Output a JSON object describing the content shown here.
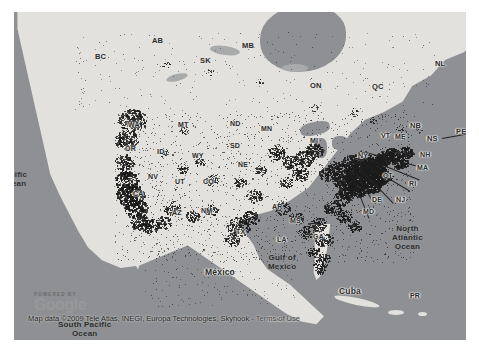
{
  "map": {
    "provider": "Google Maps",
    "attribution": {
      "powered_by": "POWERED BY",
      "brand": "Google",
      "data_line": "Map data ©2009 Tele Atlas, INEGI, Europa Technologies, Skyhook",
      "separator": " - ",
      "terms": "Terms of Use"
    },
    "ocean_labels": [
      {
        "name": "pacific-ocean",
        "text": "Pacific\nOcean",
        "x": 0,
        "y": 170
      },
      {
        "name": "north-atlantic-ocean",
        "text": "North\nAtlantic\nOcean",
        "x": 392,
        "y": 224
      },
      {
        "name": "gulf-of-mexico",
        "text": "Gulf of\nMexico",
        "x": 268,
        "y": 253
      },
      {
        "name": "south-pacific-ocean",
        "text": "South Pacific\nOcean",
        "x": 58,
        "y": 320
      }
    ],
    "country_labels": [
      {
        "name": "mexico",
        "text": "México",
        "x": 205,
        "y": 268
      },
      {
        "name": "guatemala",
        "text": "Guatemala",
        "x": 268,
        "y": 317
      },
      {
        "name": "cuba",
        "text": "Cuba",
        "x": 339,
        "y": 287
      }
    ],
    "canada_provinces": [
      {
        "code": "BC",
        "x": 95,
        "y": 53
      },
      {
        "code": "AB",
        "x": 152,
        "y": 37
      },
      {
        "code": "SK",
        "x": 200,
        "y": 57
      },
      {
        "code": "MB",
        "x": 242,
        "y": 42
      },
      {
        "code": "ON",
        "x": 310,
        "y": 82
      },
      {
        "code": "QC",
        "x": 372,
        "y": 83
      },
      {
        "code": "NL",
        "x": 435,
        "y": 60
      },
      {
        "code": "NB",
        "x": 410,
        "y": 122
      },
      {
        "code": "NS",
        "x": 427,
        "y": 135
      },
      {
        "code": "PE",
        "x": 456,
        "y": 128
      }
    ],
    "us_states": [
      {
        "code": "WA",
        "x": 128,
        "y": 121
      },
      {
        "code": "OR",
        "x": 125,
        "y": 145
      },
      {
        "code": "MT",
        "x": 178,
        "y": 121
      },
      {
        "code": "ID",
        "x": 157,
        "y": 148
      },
      {
        "code": "WY",
        "x": 192,
        "y": 152
      },
      {
        "code": "ND",
        "x": 230,
        "y": 120
      },
      {
        "code": "SD",
        "x": 230,
        "y": 142
      },
      {
        "code": "MN",
        "x": 261,
        "y": 125
      },
      {
        "code": "NE",
        "x": 238,
        "y": 161
      },
      {
        "code": "NV",
        "x": 148,
        "y": 173
      },
      {
        "code": "UT",
        "x": 175,
        "y": 178
      },
      {
        "code": "CO",
        "x": 203,
        "y": 178
      },
      {
        "code": "CA",
        "x": 133,
        "y": 190
      },
      {
        "code": "AZ",
        "x": 172,
        "y": 209
      },
      {
        "code": "NM",
        "x": 201,
        "y": 207
      },
      {
        "code": "TX",
        "x": 236,
        "y": 228
      },
      {
        "code": "AR",
        "x": 272,
        "y": 203
      },
      {
        "code": "MS",
        "x": 290,
        "y": 217
      },
      {
        "code": "LA",
        "x": 277,
        "y": 236
      },
      {
        "code": "GA",
        "x": 313,
        "y": 233
      },
      {
        "code": "MI",
        "x": 310,
        "y": 137
      },
      {
        "code": "NY",
        "x": 358,
        "y": 152
      },
      {
        "code": "VT",
        "x": 381,
        "y": 132
      },
      {
        "code": "ME",
        "x": 395,
        "y": 133
      },
      {
        "code": "NH",
        "x": 420,
        "y": 151
      },
      {
        "code": "MA",
        "x": 417,
        "y": 164
      },
      {
        "code": "CT",
        "x": 383,
        "y": 172
      },
      {
        "code": "RI",
        "x": 409,
        "y": 180
      },
      {
        "code": "DE",
        "x": 372,
        "y": 196
      },
      {
        "code": "NJ",
        "x": 396,
        "y": 196
      },
      {
        "code": "MD",
        "x": 363,
        "y": 208
      },
      {
        "code": "PR",
        "x": 410,
        "y": 292
      }
    ],
    "coverage_layer": {
      "name": "skyhook-coverage-points",
      "color": "#1b1b1b",
      "description": "Dense geolocation access-point coverage cloud"
    }
  }
}
